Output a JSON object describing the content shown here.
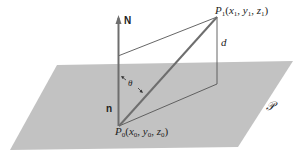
{
  "diagram": {
    "type": "geometry",
    "colors": {
      "plane": "#c2c2c2",
      "vectors": "#6e6e6e",
      "thin_lines": "#555555",
      "text": "#222222"
    },
    "labels": {
      "normal_big": "N",
      "normal_small": "n",
      "angle": "θ",
      "distance": "d",
      "plane_symbol": "𝒫",
      "p1_name": "P",
      "p1_sub": "1",
      "p1_coords": [
        "x",
        "1",
        "y",
        "1",
        "z",
        "1"
      ],
      "p0_name": "P",
      "p0_sub": "0",
      "p0_coords": [
        "x",
        "0",
        "y",
        "0",
        "z",
        "0"
      ]
    }
  }
}
